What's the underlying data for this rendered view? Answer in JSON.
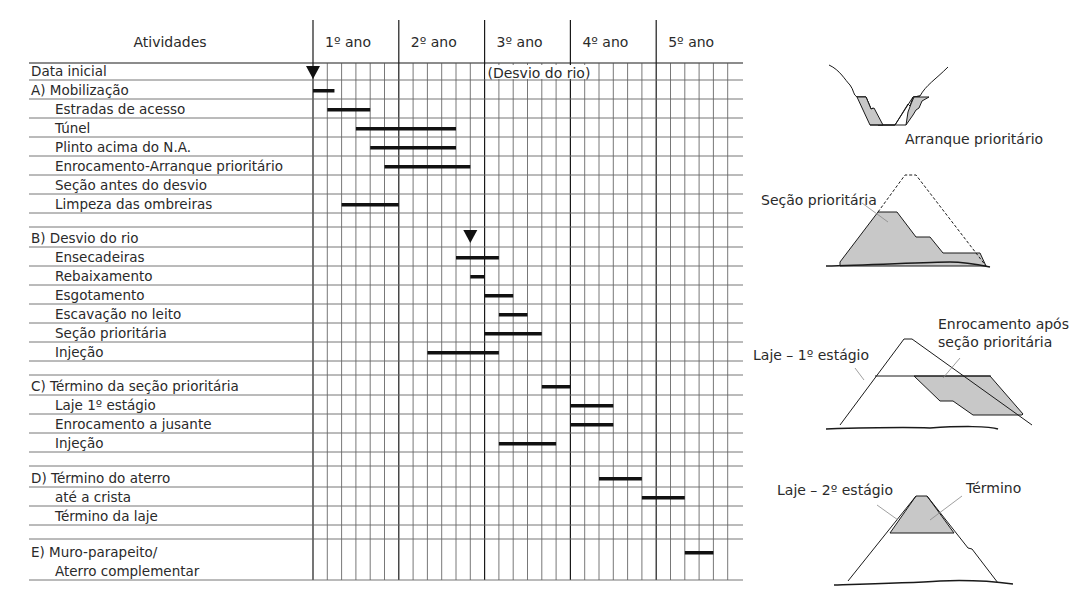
{
  "chart_data": {
    "type": "gantt",
    "title": "",
    "header": {
      "activities_label": "Atividades",
      "years": [
        "1º ano",
        "2º ano",
        "3º ano",
        "4º ano",
        "5º ano"
      ]
    },
    "subdivisions_per_year": 6,
    "rows": [
      {
        "label": "Data inicial",
        "indent": 0,
        "h": 17,
        "marker": 0
      },
      {
        "label": "A) Mobilização",
        "indent": 0,
        "h": 19,
        "bar": [
          0,
          1.5
        ]
      },
      {
        "label": "Estradas de acesso",
        "indent": 1,
        "h": 19,
        "bar": [
          1,
          4
        ]
      },
      {
        "label": "Túnel",
        "indent": 1,
        "h": 19,
        "bar": [
          3,
          10
        ]
      },
      {
        "label": "Plinto acima do N.A.",
        "indent": 1,
        "h": 19,
        "bar": [
          4,
          10
        ]
      },
      {
        "label": "Enrocamento-Arranque prioritário",
        "indent": 1,
        "h": 19,
        "bar": [
          5,
          11
        ]
      },
      {
        "label": "Seção antes do desvio",
        "indent": 1,
        "h": 19
      },
      {
        "label": "Limpeza das ombreiras",
        "indent": 1,
        "h": 19,
        "bar": [
          2,
          6
        ]
      },
      {
        "label": "",
        "indent": 0,
        "h": 14
      },
      {
        "label": "B)  Desvio do rio",
        "indent": 0,
        "h": 20,
        "marker": 11
      },
      {
        "label": "Ensecadeiras",
        "indent": 1,
        "h": 19,
        "bar": [
          10,
          13
        ]
      },
      {
        "label": "Rebaixamento",
        "indent": 1,
        "h": 19,
        "bar": [
          11,
          12
        ]
      },
      {
        "label": "Esgotamento",
        "indent": 1,
        "h": 19,
        "bar": [
          12,
          14
        ]
      },
      {
        "label": "Escavação no leito",
        "indent": 1,
        "h": 19,
        "bar": [
          13,
          15
        ]
      },
      {
        "label": "Seção prioritária",
        "indent": 1,
        "h": 19,
        "bar": [
          12,
          16
        ]
      },
      {
        "label": "Injeção",
        "indent": 1,
        "h": 19,
        "bar": [
          8,
          13
        ]
      },
      {
        "label": "",
        "indent": 0,
        "h": 14
      },
      {
        "label": "C) Término da seção prioritária",
        "indent": 0,
        "h": 20,
        "bar": [
          16,
          18
        ]
      },
      {
        "label": "Laje 1º estágio",
        "indent": 1,
        "h": 19,
        "bar": [
          18,
          21
        ]
      },
      {
        "label": "Enrocamento a jusante",
        "indent": 1,
        "h": 19,
        "bar": [
          18,
          21
        ]
      },
      {
        "label": "Injeção",
        "indent": 1,
        "h": 19,
        "bar": [
          13,
          17
        ]
      },
      {
        "label": "",
        "indent": 0,
        "h": 14
      },
      {
        "label": "D) Término do aterro",
        "indent": 0,
        "h": 21,
        "bar": [
          20,
          23
        ]
      },
      {
        "label": "até a crista",
        "indent": 1,
        "h": 19,
        "bar": [
          23,
          26
        ]
      },
      {
        "label": "Término da laje",
        "indent": 1,
        "h": 19
      },
      {
        "label": "",
        "indent": 0,
        "h": 14
      },
      {
        "label": "E)  Muro-parapeito/",
        "indent": 0,
        "h": 22,
        "bar": [
          26,
          28
        ]
      },
      {
        "label": "Aterro complementar",
        "indent": 1,
        "h": 19,
        "continuation": true
      }
    ],
    "annotations": [
      {
        "text": "(Desvio do rio)",
        "row": 0,
        "col": 12.2
      }
    ]
  },
  "diagrams": [
    {
      "id": "arranque",
      "labels": [
        "Arranque prioritário"
      ]
    },
    {
      "id": "secao",
      "labels": [
        "Seção prioritária"
      ]
    },
    {
      "id": "laje1",
      "labels": [
        "Laje – 1º estágio",
        "Enrocamento após",
        "seção prioritária"
      ]
    },
    {
      "id": "laje2",
      "labels": [
        "Laje – 2º estágio",
        "Término"
      ]
    }
  ],
  "colors": {
    "line": "#1a1a1a",
    "grid": "#555555",
    "rowline": "#666666",
    "fill": "#c8c8c8",
    "bar": "#111111"
  }
}
